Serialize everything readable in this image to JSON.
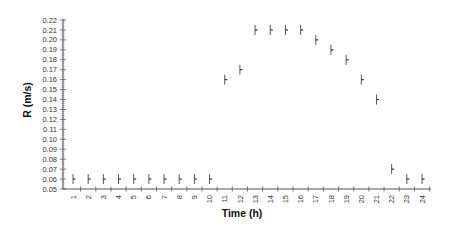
{
  "chart_data": {
    "type": "scatter",
    "title": "",
    "xlabel": "Time (h)",
    "ylabel": "R (m/s)",
    "x": [
      1,
      2,
      3,
      4,
      5,
      6,
      7,
      8,
      9,
      10,
      11,
      12,
      13,
      14,
      15,
      16,
      17,
      18,
      19,
      20,
      21,
      22,
      23,
      24
    ],
    "series": [
      {
        "name": "R",
        "values": [
          0.06,
          0.06,
          0.06,
          0.06,
          0.06,
          0.06,
          0.06,
          0.06,
          0.06,
          0.06,
          0.16,
          0.17,
          0.21,
          0.21,
          0.21,
          0.21,
          0.2,
          0.19,
          0.18,
          0.16,
          0.14,
          0.07,
          0.06,
          0.06
        ],
        "error_bars": true
      }
    ],
    "xticks": [
      "1",
      "2",
      "3",
      "4",
      "5",
      "6",
      "7",
      "8",
      "9",
      "10",
      "11",
      "12",
      "13",
      "14",
      "15",
      "16",
      "17",
      "18",
      "19",
      "20",
      "21",
      "22",
      "23",
      "24"
    ],
    "yticks": [
      "0.05",
      "0.06",
      "0.07",
      "0.08",
      "0.09",
      "0.10",
      "0.11",
      "0.12",
      "0.13",
      "0.14",
      "0.15",
      "0.16",
      "0.17",
      "0.18",
      "0.19",
      "0.20",
      "0.21",
      "0.22"
    ],
    "ylim": [
      0.05,
      0.22
    ],
    "xlim": [
      0.5,
      24.5
    ],
    "grid": false,
    "legend": null,
    "xtick_rotation": -90
  }
}
